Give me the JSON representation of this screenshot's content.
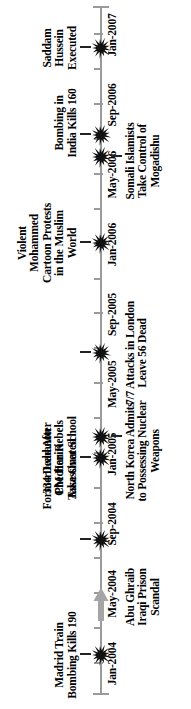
{
  "figure": {
    "orientation": "vertical-rotated-timeline",
    "axis_color": "#9a9a9a",
    "marker_color": "#111111",
    "arrow_color": "#a5a5a5"
  },
  "chart_data": {
    "type": "timeline",
    "title": "",
    "xlabel": "",
    "ylabel": "",
    "axis_range": [
      "Jan-2004",
      "Jan-2007"
    ],
    "grid": false,
    "legend": "none",
    "tick_labels": [
      "Jan-2004",
      "May-2004",
      "Sep-2004",
      "Jan-2005",
      "May-2005",
      "Sep-2005",
      "Jan-2006",
      "May-2006",
      "Sep-2006",
      "Jan-2007"
    ],
    "events": [
      {
        "label": "Madrid Train\nBombing Kills 190",
        "date": "Jan-2004",
        "side": "above"
      },
      {
        "label": "Abu Ghraib\nIraqi Prison\nScandal",
        "date": "May-2004",
        "side": "below"
      },
      {
        "label": "334 Dead After\nChechen Rebels\nTake Over School",
        "date": "Sep-2004",
        "side": "above"
      },
      {
        "label": "North Korea Admits\nto Possessing Nuclear\nWeapons",
        "date": "Jan-2005",
        "side": "below"
      },
      {
        "label": "Former Lebanon\nPM Hariri\nAssassinated",
        "date": "Feb-2005",
        "side": "above"
      },
      {
        "label": "7/7 Attacks in London\nLeave 56 Dead",
        "date": "Jul-2005",
        "side": "below"
      },
      {
        "label": "Violent\nMohammed\nCartoon Protests\nin the Muslim\nWorld",
        "date": "Jan-2006",
        "side": "above"
      },
      {
        "label": "Somali Islamists\nTake Control of\nMogadishu",
        "date": "Jun-2006",
        "side": "below"
      },
      {
        "label": "Bombing in\nIndia Kills 160",
        "date": "Jul-2006",
        "side": "above"
      },
      {
        "label": "Saddam\nHussein\nExecuted",
        "date": "Dec-2006",
        "side": "above"
      }
    ]
  },
  "axis": {
    "ticks": [
      {
        "label": "Jan-2004",
        "pos": 6.2,
        "major": true
      },
      {
        "label": "",
        "pos": 13.6,
        "major": false
      },
      {
        "label": "May-2004",
        "pos": 21.0,
        "major": true
      },
      {
        "label": "",
        "pos": 28.4,
        "major": false
      },
      {
        "label": "Sep-2004",
        "pos": 35.8,
        "major": true
      },
      {
        "label": "",
        "pos": 43.2,
        "major": false
      },
      {
        "label": "Jan-2005",
        "pos": 50.6,
        "major": true
      },
      {
        "label": "",
        "pos": 58.0,
        "major": false
      },
      {
        "label": "May-2005",
        "pos": 65.4,
        "major": true
      },
      {
        "label": "",
        "pos": 72.8,
        "major": false
      },
      {
        "label": "Sep-2005",
        "pos": 80.2,
        "major": true
      },
      {
        "label": "",
        "pos": 87.6,
        "major": false
      },
      {
        "label": "Jan-2006",
        "pos": 95.0,
        "major": true
      },
      {
        "label": "",
        "pos": 102.4,
        "major": false
      },
      {
        "label": "May-2006",
        "pos": 109.8,
        "major": true
      },
      {
        "label": "",
        "pos": 117.2,
        "major": false
      },
      {
        "label": "Sep-2006",
        "pos": 124.6,
        "major": true
      },
      {
        "label": "",
        "pos": 132.0,
        "major": false
      },
      {
        "label": "Jan-2007",
        "pos": 139.4,
        "major": true
      }
    ]
  },
  "markers": {
    "items": [
      {
        "name": "madrid-train-bombing",
        "pos": 54,
        "side": "above"
      },
      {
        "name": "chechen-school-siege",
        "pos": 169,
        "side": "above"
      },
      {
        "name": "hariri-assassination",
        "pos": 251,
        "side": "above"
      },
      {
        "name": "north-korea-nuclear",
        "pos": 272,
        "side": "below"
      },
      {
        "name": "london-7-7-attacks",
        "pos": 356,
        "side": "above"
      },
      {
        "name": "mohammed-cartoon-protests",
        "pos": 466,
        "side": "above"
      },
      {
        "name": "somali-islamists-mogadishu",
        "pos": 552,
        "side": "below"
      },
      {
        "name": "india-bombing",
        "pos": 574,
        "side": "above"
      },
      {
        "name": "saddam-hussein-executed",
        "pos": 661,
        "side": "above"
      }
    ]
  },
  "arrow": {
    "pos": 105,
    "name": "timeline-progress-arrow"
  }
}
